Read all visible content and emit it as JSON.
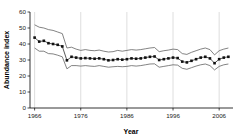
{
  "chart_data": {
    "type": "line",
    "title": "",
    "xlabel": "Year",
    "ylabel": "Abundance index",
    "xlim": [
      1965,
      2009
    ],
    "ylim": [
      0,
      60
    ],
    "xticks": [
      1966,
      1976,
      1986,
      1996,
      2006
    ],
    "yticks": [
      0,
      10,
      20,
      30,
      40,
      50,
      60
    ],
    "grid": "vertical gridlines at x tick positions",
    "legend": "none",
    "x": [
      1966,
      1967,
      1968,
      1969,
      1970,
      1971,
      1972,
      1973,
      1974,
      1975,
      1976,
      1977,
      1978,
      1979,
      1980,
      1981,
      1982,
      1983,
      1984,
      1985,
      1986,
      1987,
      1988,
      1989,
      1990,
      1991,
      1992,
      1993,
      1994,
      1995,
      1996,
      1997,
      1998,
      1999,
      2000,
      2001,
      2002,
      2003,
      2004,
      2005,
      2006,
      2007,
      2008
    ],
    "series": [
      {
        "name": "Abundance index (mean)",
        "marker": "filled-square",
        "values": [
          44.0,
          41.5,
          42.0,
          40.5,
          40.0,
          39.5,
          38.5,
          29.8,
          32.0,
          31.5,
          31.0,
          31.2,
          31.0,
          30.8,
          31.0,
          30.5,
          29.8,
          30.0,
          30.5,
          30.2,
          30.5,
          31.0,
          30.8,
          31.0,
          31.5,
          32.0,
          32.2,
          30.0,
          30.5,
          31.0,
          31.5,
          31.2,
          29.0,
          28.5,
          29.5,
          30.5,
          31.5,
          32.0,
          31.0,
          28.0,
          30.5,
          31.5,
          32.0
        ]
      },
      {
        "name": "Upper confidence limit",
        "style": "thin-line",
        "values": [
          52.0,
          50.5,
          50.0,
          49.0,
          48.5,
          47.5,
          46.5,
          37.5,
          38.0,
          36.8,
          36.0,
          36.5,
          36.0,
          35.8,
          36.2,
          35.5,
          35.0,
          35.2,
          36.0,
          35.5,
          36.0,
          36.5,
          36.2,
          36.5,
          37.0,
          37.5,
          37.8,
          35.2,
          35.8,
          36.2,
          36.8,
          36.5,
          34.0,
          33.5,
          34.8,
          35.8,
          36.8,
          37.5,
          36.5,
          33.2,
          35.8,
          36.8,
          37.5
        ]
      },
      {
        "name": "Lower confidence limit",
        "style": "thin-line",
        "values": [
          37.5,
          35.5,
          35.5,
          34.0,
          33.8,
          33.0,
          32.0,
          24.5,
          26.5,
          26.5,
          26.2,
          26.5,
          26.2,
          26.0,
          26.5,
          26.0,
          25.5,
          25.8,
          26.0,
          25.8,
          26.0,
          26.5,
          26.2,
          26.5,
          27.0,
          27.5,
          27.6,
          25.5,
          26.0,
          26.5,
          27.0,
          26.8,
          24.8,
          24.2,
          25.2,
          26.2,
          27.0,
          27.5,
          26.5,
          23.8,
          26.0,
          27.0,
          27.5
        ]
      }
    ]
  },
  "colors": {
    "line": "#4d4d4d",
    "marker": "#111111",
    "axis": "#000000",
    "grid": "#c8c8c8",
    "background": "#ffffff"
  }
}
